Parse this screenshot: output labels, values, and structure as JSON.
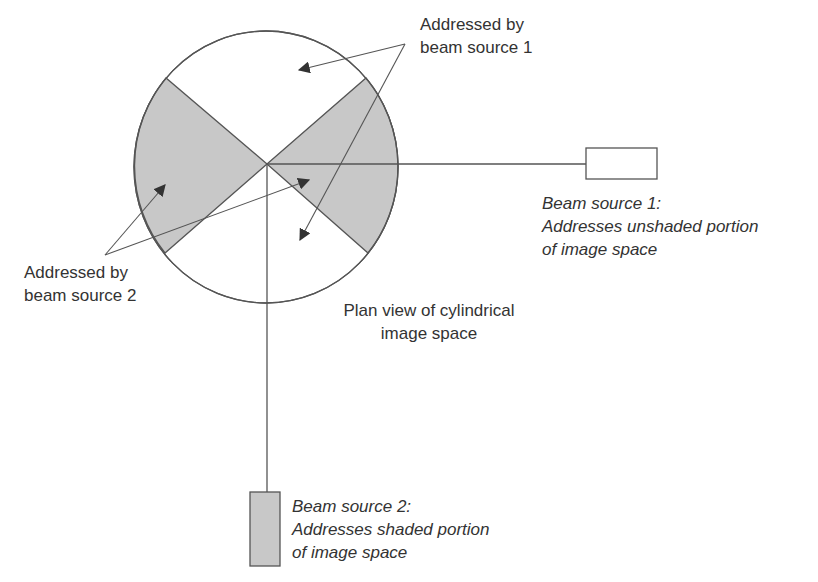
{
  "diagram": {
    "type": "plan-view-schematic",
    "colors": {
      "shaded": "#c8c8c8",
      "stroke": "#555555",
      "text": "#333333",
      "background": "#ffffff"
    },
    "image_space": {
      "label_line1": "Plan view of cylindrical",
      "label_line2": "image space"
    },
    "callouts": {
      "beam1_region": {
        "line1": "Addressed by",
        "line2": "beam source 1"
      },
      "beam2_region": {
        "line1": "Addressed by",
        "line2": "beam source 2"
      }
    },
    "beam_sources": [
      {
        "name": "Beam source 1",
        "title": "Beam source 1:",
        "desc_line1": "Addresses unshaded portion",
        "desc_line2": "of image space",
        "fill": "#ffffff"
      },
      {
        "name": "Beam source 2",
        "title": "Beam source 2:",
        "desc_line1": "Addresses shaded portion",
        "desc_line2": "of image space",
        "fill": "#c8c8c8"
      }
    ]
  }
}
